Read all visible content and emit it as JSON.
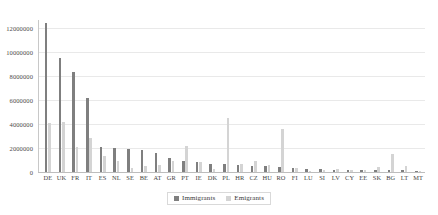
{
  "chart_data": {
    "type": "bar",
    "title": "",
    "subtitle": "",
    "xlabel": "",
    "ylabel": "",
    "ylim": [
      0,
      12400000
    ],
    "yticks": [
      0,
      2000000,
      4000000,
      6000000,
      8000000,
      10000000,
      12000000
    ],
    "ytick_labels": [
      "0",
      "2000000",
      "4000000",
      "6000000",
      "8000000",
      "10000000",
      "12000000"
    ],
    "grid": true,
    "legend_position": "bottom-center",
    "categories": [
      "DE",
      "UK",
      "FR",
      "IT",
      "ES",
      "NL",
      "SE",
      "BE",
      "AT",
      "GR",
      "PT",
      "IE",
      "DK",
      "PL",
      "HR",
      "CZ",
      "HU",
      "RO",
      "FI",
      "LU",
      "SI",
      "LV",
      "CY",
      "EE",
      "SK",
      "BG",
      "LT",
      "MT"
    ],
    "series": [
      {
        "name": "Immigrants",
        "color": "#7f7f7f",
        "values": [
          12400000,
          9500000,
          8300000,
          6200000,
          2100000,
          2000000,
          1900000,
          1800000,
          1600000,
          1200000,
          900000,
          800000,
          700000,
          650000,
          600000,
          520000,
          480000,
          400000,
          330000,
          260000,
          230000,
          200000,
          190000,
          180000,
          160000,
          140000,
          130000,
          60000
        ],
        "labels": [
          "12400000",
          "9500000",
          "8300000",
          "6200000",
          "2100000",
          "2000000",
          "1900000",
          "1800000",
          "1600000",
          "1200000",
          "900000",
          "800000",
          "700000",
          "650000",
          "600000",
          "520000",
          "480000",
          "400000",
          "330000",
          "260000",
          "230000",
          "200000",
          "190000",
          "180000",
          "160000",
          "140000",
          "130000",
          "60000"
        ]
      },
      {
        "name": "Emigrants",
        "color": "#d4d4d4",
        "values": [
          4100000,
          4200000,
          2100000,
          2800000,
          1300000,
          950000,
          330000,
          480000,
          560000,
          900000,
          2200000,
          800000,
          250000,
          4500000,
          700000,
          900000,
          600000,
          3600000,
          300000,
          80000,
          140000,
          280000,
          150000,
          200000,
          400000,
          1500000,
          500000,
          90000
        ],
        "labels": [
          "4100000",
          "4200000",
          "2100000",
          "2800000",
          "1300000",
          "950000",
          "330000",
          "480000",
          "560000",
          "900000",
          "2200000",
          "800000",
          "250000",
          "4500000",
          "700000",
          "900000",
          "600000",
          "3600000",
          "300000",
          "80000",
          "140000",
          "280000",
          "150000",
          "200000",
          "400000",
          "1500000",
          "500000",
          "90000"
        ]
      }
    ]
  },
  "legend": {
    "items": [
      {
        "label": "Immigrants",
        "color": "#7f7f7f"
      },
      {
        "label": "Emigrants",
        "color": "#d4d4d4"
      }
    ]
  },
  "colors": {
    "immigrants": "#7f7f7f",
    "emigrants": "#d4d4d4",
    "gridline": "#e9e9e9",
    "axis": "#c8c8c8",
    "background": "#ffffff",
    "text": "#3a3a3a"
  }
}
